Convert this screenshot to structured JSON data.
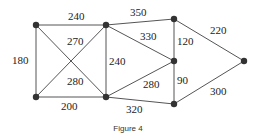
{
  "figure": {
    "caption": "Figure 4",
    "nodes": [
      {
        "id": "A",
        "x": 36,
        "y": 25
      },
      {
        "id": "B",
        "x": 106,
        "y": 25
      },
      {
        "id": "C",
        "x": 174,
        "y": 19
      },
      {
        "id": "D",
        "x": 174,
        "y": 61
      },
      {
        "id": "E",
        "x": 244,
        "y": 61
      },
      {
        "id": "F",
        "x": 36,
        "y": 97
      },
      {
        "id": "G",
        "x": 106,
        "y": 97
      },
      {
        "id": "H",
        "x": 174,
        "y": 104
      }
    ],
    "edges": [
      {
        "from": "A",
        "to": "B",
        "weight": "240",
        "lx": 68,
        "ly": 20
      },
      {
        "from": "A",
        "to": "F",
        "weight": "180",
        "lx": 12,
        "ly": 64
      },
      {
        "from": "A",
        "to": "G",
        "weight": "270",
        "lx": 67,
        "ly": 45
      },
      {
        "from": "B",
        "to": "F",
        "weight": "280",
        "lx": 67,
        "ly": 85
      },
      {
        "from": "B",
        "to": "G",
        "weight": "240",
        "lx": 109,
        "ly": 65
      },
      {
        "from": "F",
        "to": "G",
        "weight": "200",
        "lx": 61,
        "ly": 110
      },
      {
        "from": "B",
        "to": "C",
        "weight": "350",
        "lx": 130,
        "ly": 16
      },
      {
        "from": "B",
        "to": "D",
        "weight": "330",
        "lx": 140,
        "ly": 40
      },
      {
        "from": "C",
        "to": "D",
        "weight": "120",
        "lx": 177,
        "ly": 45
      },
      {
        "from": "C",
        "to": "E",
        "weight": "220",
        "lx": 210,
        "ly": 34
      },
      {
        "from": "D",
        "to": "G",
        "weight": "280",
        "lx": 143,
        "ly": 88
      },
      {
        "from": "D",
        "to": "H",
        "weight": "90",
        "lx": 177,
        "ly": 84
      },
      {
        "from": "G",
        "to": "H",
        "weight": "320",
        "lx": 126,
        "ly": 113
      },
      {
        "from": "H",
        "to": "E",
        "weight": "300",
        "lx": 210,
        "ly": 95
      }
    ]
  }
}
